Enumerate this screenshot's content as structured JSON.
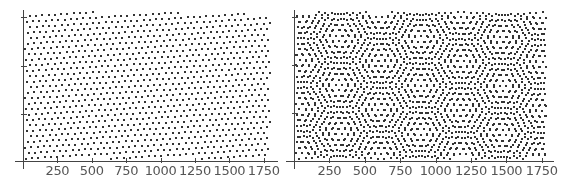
{
  "chart_data": [
    {
      "type": "scatter",
      "title": "",
      "description": "Single triangular lattice of points, slightly rotated",
      "xlabel": "",
      "ylabel": "",
      "xticks": [
        250,
        500,
        750,
        1000,
        1250,
        1500,
        1750
      ],
      "xlim": [
        0,
        1800
      ],
      "ytick_count": 3,
      "grid": false,
      "lattice_count": 1,
      "lattice_spacing_px": 6.3,
      "rotation_deg": [
        -3.5
      ],
      "plot": {
        "origin_x": 23,
        "axis_y": 161,
        "top": 12,
        "right": 270,
        "px_per_unit": 0.1376
      },
      "ytick_px": [
        17,
        66,
        114
      ],
      "dot_color": "#333333"
    },
    {
      "type": "scatter",
      "title": "",
      "description": "Two overlaid triangular lattices with relative rotation forming a hexagonal moire pattern",
      "xlabel": "",
      "ylabel": "",
      "xticks": [
        250,
        500,
        750,
        1000,
        1250,
        1500,
        1750
      ],
      "xlim": [
        0,
        1800
      ],
      "ytick_count": 3,
      "grid": false,
      "lattice_count": 2,
      "lattice_spacing_px": 6.3,
      "rotation_deg": [
        -3.5,
        4.2
      ],
      "plot": {
        "origin_x": 10,
        "axis_y": 161,
        "top": 12,
        "right": 262,
        "px_per_unit": 0.1416
      },
      "ytick_px": [
        17,
        65,
        113
      ],
      "dot_color": "#333333"
    }
  ],
  "panels": [
    {
      "xtick_labels": [
        "250",
        "500",
        "750",
        "1000",
        "1250",
        "1500",
        "1750"
      ]
    },
    {
      "xtick_labels": [
        "250",
        "500",
        "750",
        "1000",
        "1250",
        "1500",
        "1750"
      ]
    }
  ],
  "colors": {
    "axis": "#444444",
    "text": "#555555",
    "background": "#ffffff"
  }
}
